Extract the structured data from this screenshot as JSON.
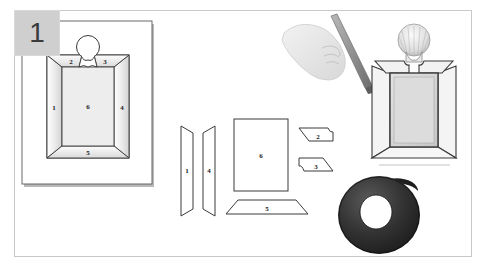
{
  "illustration": {
    "title": "Picture frame assembly instruction step",
    "step_number": "1",
    "background_color": "#ffffff",
    "border_color": "#c9c9c9",
    "line_color": "#3a3a3a",
    "badge_color": "#cfcfcf",
    "tape_color": "#262626"
  },
  "panel_left": {
    "name": "frame-plan-panel",
    "caption": "Assembled frame front view with numbered bevel sections",
    "parts": [
      {
        "id": "1",
        "label": "1",
        "role": "left-bevel"
      },
      {
        "id": "2",
        "label": "2",
        "role": "top-left-bevel"
      },
      {
        "id": "3",
        "label": "3",
        "role": "top-right-bevel"
      },
      {
        "id": "4",
        "label": "4",
        "role": "right-bevel"
      },
      {
        "id": "5",
        "label": "5",
        "role": "bottom-bevel"
      },
      {
        "id": "6",
        "label": "6",
        "role": "center-panel"
      }
    ],
    "ornament": "shell-ornament"
  },
  "panel_middle": {
    "name": "cut-pieces-panel",
    "caption": "Flat cut pieces laid out separately",
    "pieces": [
      {
        "id": "1",
        "label": "1",
        "shape": "tapered-strip"
      },
      {
        "id": "4",
        "label": "4",
        "shape": "tapered-strip"
      },
      {
        "id": "6",
        "label": "6",
        "shape": "rectangle"
      },
      {
        "id": "2",
        "label": "2",
        "shape": "notched-trapezoid"
      },
      {
        "id": "3",
        "label": "3",
        "shape": "notched-trapezoid-mirrored"
      },
      {
        "id": "5",
        "label": "5",
        "shape": "wide-trapezoid"
      }
    ]
  },
  "panel_right": {
    "name": "assembly-panel",
    "caption": "Hand with tool assembling the three dimensional frame",
    "objects": [
      {
        "name": "hand-holding-tool",
        "label": "hand"
      },
      {
        "name": "tool-stick",
        "label": "tool"
      },
      {
        "name": "shell-ornament",
        "label": "shell"
      },
      {
        "name": "folded-frame",
        "label": "frame"
      },
      {
        "name": "tape-roll",
        "label": "tape"
      }
    ]
  }
}
